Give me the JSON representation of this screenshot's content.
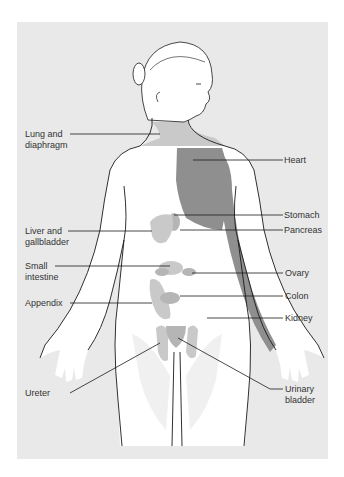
{
  "figure": {
    "top_cut_text": "",
    "colors": {
      "background": "#e9e9e9",
      "skin": "#ffffff",
      "outline": "#1a1a1a",
      "referred_pain_dark": "#8f8f8f",
      "referred_pain_light": "#c9c9c9",
      "organ_medium": "#b5b5b5"
    },
    "labels_left": [
      {
        "id": "lung",
        "text": "Lung and\ndiaphragm"
      },
      {
        "id": "liver",
        "text": "Liver and\ngallbladder"
      },
      {
        "id": "small-intestine",
        "text": "Small\nintestine"
      },
      {
        "id": "appendix",
        "text": "Appendix"
      },
      {
        "id": "ureter",
        "text": "Ureter"
      }
    ],
    "labels_right": [
      {
        "id": "heart",
        "text": "Heart"
      },
      {
        "id": "stomach",
        "text": "Stomach"
      },
      {
        "id": "pancreas",
        "text": "Pancreas"
      },
      {
        "id": "ovary",
        "text": "Ovary"
      },
      {
        "id": "colon",
        "text": "Colon"
      },
      {
        "id": "kidney",
        "text": "Kidney"
      },
      {
        "id": "urinary-bladder",
        "text": "Urinary\nbladder"
      }
    ]
  }
}
